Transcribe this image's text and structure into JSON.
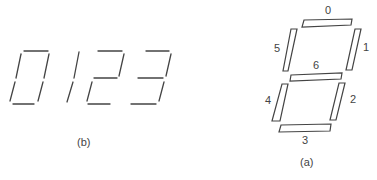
{
  "figure_b": {
    "caption": "(b)",
    "digits": [
      "0",
      "1",
      "2",
      "3"
    ]
  },
  "figure_a": {
    "caption": "(a)",
    "segment_labels": {
      "top": "0",
      "upper_right": "1",
      "lower_right": "2",
      "bottom": "3",
      "lower_left": "4",
      "upper_left": "5",
      "middle": "6"
    }
  },
  "colors": {
    "stroke": "#444444",
    "background": "#ffffff"
  }
}
